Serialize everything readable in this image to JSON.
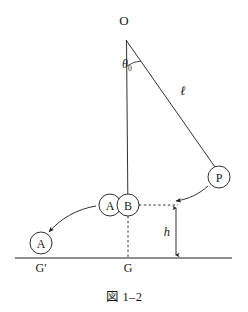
{
  "figure": {
    "caption": "図 1–2",
    "background_color": "#ffffff",
    "ink_color": "#1a1a1a",
    "points": {
      "pivot_label": "O",
      "bob_label": "P",
      "node_a_upper_label": "A",
      "node_b_label": "B",
      "node_a_lower_label": "A",
      "ground_origin_label": "G",
      "ground_prime_label": "G'"
    },
    "measures": {
      "angle_symbol": "θ",
      "angle_subscript": "0",
      "length_symbol": "ℓ",
      "height_symbol": "h"
    },
    "geometry": {
      "pivot": {
        "x": 124,
        "y": 32
      },
      "bob": {
        "x": 219,
        "y": 177,
        "r": 11
      },
      "node_a_upper": {
        "x": 110,
        "y": 205,
        "r": 11
      },
      "node_b": {
        "x": 128,
        "y": 205,
        "r": 11
      },
      "node_a_lower": {
        "x": 41,
        "y": 243,
        "r": 11
      },
      "ground_line": {
        "x1": 15,
        "x2": 232,
        "y": 258
      },
      "dashed_horizontal": {
        "x1": 139,
        "x2": 176,
        "y": 205
      },
      "dashed_vertical": {
        "x": 128,
        "y1": 216,
        "y2": 258
      },
      "height_line": {
        "x": 176,
        "y1": 205,
        "y2": 258
      }
    }
  }
}
